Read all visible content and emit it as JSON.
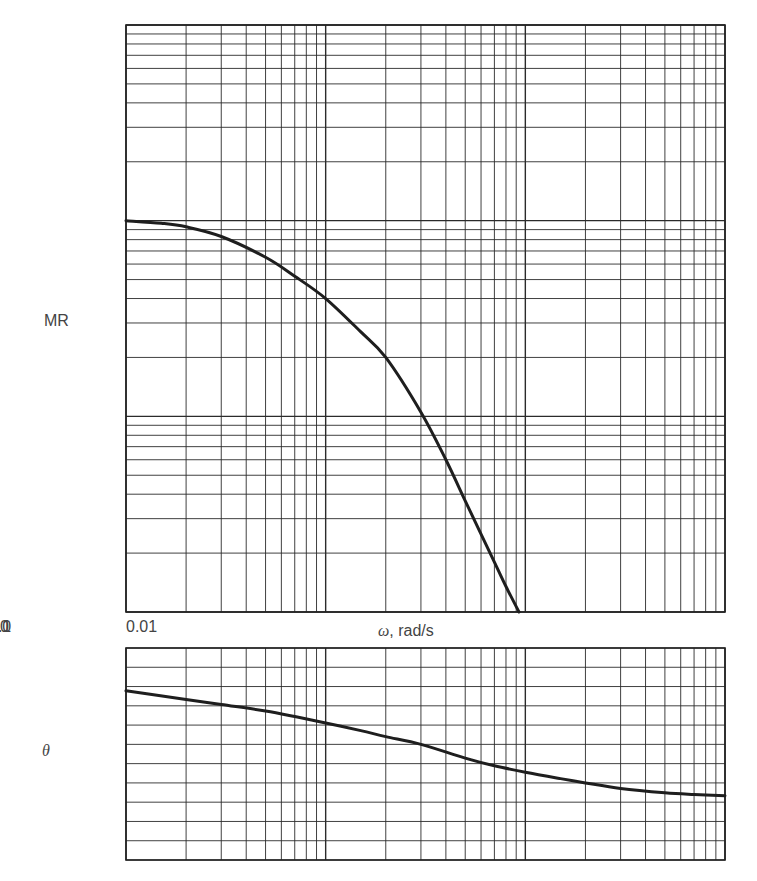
{
  "chart_data": [
    {
      "type": "line",
      "name": "magnitude-ratio",
      "title": "",
      "xlabel": "ω, rad/s",
      "ylabel": "MR",
      "xscale": "log",
      "yscale": "log",
      "xlim": [
        0.01,
        10
      ],
      "ylim": [
        0.01,
        10
      ],
      "grid": true,
      "x_tick_labels": [
        {
          "value": 0.01,
          "label": "0.01"
        },
        {
          "value": 0.1,
          "label": "0.1"
        },
        {
          "value": 1,
          "label": "1.0"
        },
        {
          "value": 10,
          "label": "10"
        }
      ],
      "y_tick_labels": [
        {
          "value": 0.01,
          "label": "0.01"
        },
        {
          "value": 0.1,
          "label": "0.1"
        },
        {
          "value": 1,
          "label": "1.0"
        },
        {
          "value": 10,
          "label": "10"
        }
      ],
      "series": [
        {
          "name": "MR",
          "x": [
            0.01,
            0.015,
            0.02,
            0.03,
            0.05,
            0.07,
            0.1,
            0.15,
            0.2,
            0.3,
            0.4,
            0.5,
            0.6,
            0.7,
            0.8,
            0.93
          ],
          "y": [
            1.0,
            0.97,
            0.93,
            0.83,
            0.65,
            0.52,
            0.4,
            0.27,
            0.2,
            0.105,
            0.06,
            0.037,
            0.025,
            0.018,
            0.0135,
            0.01
          ]
        }
      ]
    },
    {
      "type": "line",
      "name": "phase-angle",
      "title": "",
      "xlabel": "",
      "ylabel": "θ",
      "xscale": "log",
      "xlim": [
        0.01,
        10
      ],
      "ylim": [
        -405,
        90
      ],
      "grid": true,
      "y_tick_labels": [
        {
          "value": 90,
          "label": "90°"
        },
        {
          "value": 0,
          "label": "0°"
        },
        {
          "value": -90,
          "label": "-90°"
        },
        {
          "value": -180,
          "label": "-180°"
        },
        {
          "value": -270,
          "label": "-270°"
        },
        {
          "value": -360,
          "label": "-360°"
        }
      ],
      "series": [
        {
          "name": "θ",
          "x": [
            0.01,
            0.02,
            0.03,
            0.05,
            0.07,
            0.1,
            0.15,
            0.2,
            0.3,
            0.5,
            0.7,
            1.0,
            1.5,
            2,
            3,
            5,
            7,
            10
          ],
          "y": [
            -10,
            -30,
            -42,
            -57,
            -70,
            -85,
            -103,
            -117,
            -135,
            -167,
            -185,
            -200,
            -215,
            -225,
            -238,
            -248,
            -252,
            -255
          ]
        }
      ]
    }
  ]
}
